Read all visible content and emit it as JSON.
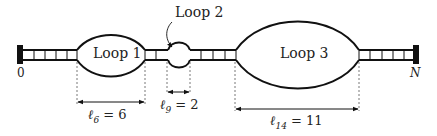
{
  "diagram": {
    "type": "ssDNA-loop-ladder",
    "loops": [
      {
        "label": "Loop 1"
      },
      {
        "label": "Loop 2"
      },
      {
        "label": "Loop 3"
      }
    ],
    "ends": {
      "left": "0",
      "right": "N"
    },
    "lengths": [
      {
        "label": "ℓ6 = 6",
        "sym": "ℓ",
        "sub": "6",
        "value": "= 6"
      },
      {
        "label": "ℓ9 = 2",
        "sym": "ℓ",
        "sub": "9",
        "value": "= 2"
      },
      {
        "label": "ℓ14 = 11",
        "sym": "ℓ",
        "sub": "14",
        "value": "= 11"
      }
    ],
    "colors": {
      "stroke": "#111111",
      "background": "#ffffff",
      "dash": "#555555"
    }
  }
}
